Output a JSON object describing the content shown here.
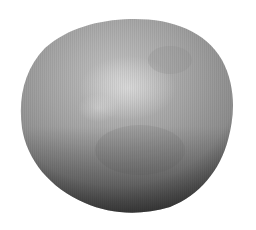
{
  "image": {
    "subject": "grey rough spherical body",
    "alt": "Grey, slightly irregular spherical object with mottled surface on a white background",
    "background_color": "#ffffff",
    "colors": {
      "highlight": "#c8c8c8",
      "midtone": "#9a9a9a",
      "shadow": "#2a2a2a",
      "rim": "#111111"
    }
  }
}
